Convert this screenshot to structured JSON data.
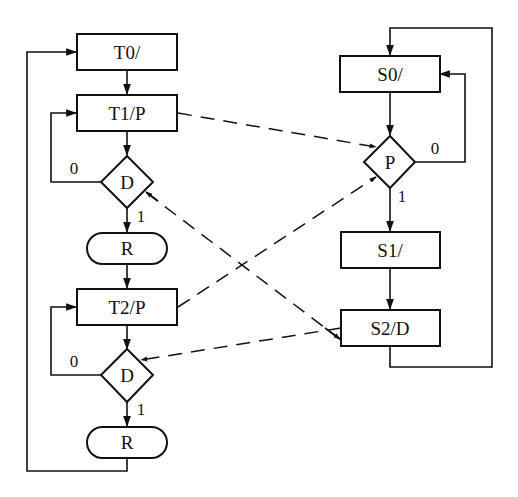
{
  "diagram": {
    "left_flow": {
      "nodes": [
        {
          "id": "T0",
          "type": "box",
          "label": "T0/"
        },
        {
          "id": "T1",
          "type": "box",
          "label": "T1/P"
        },
        {
          "id": "D1",
          "type": "decision",
          "label": "D"
        },
        {
          "id": "R1",
          "type": "terminal",
          "label": "R"
        },
        {
          "id": "T2",
          "type": "box",
          "label": "T2/P"
        },
        {
          "id": "D2",
          "type": "decision",
          "label": "D"
        },
        {
          "id": "R2",
          "type": "terminal",
          "label": "R"
        }
      ],
      "edge_labels": {
        "d1_no": "0",
        "d1_yes": "1",
        "d2_no": "0",
        "d2_yes": "1"
      }
    },
    "right_flow": {
      "nodes": [
        {
          "id": "S0",
          "type": "box",
          "label": "S0/"
        },
        {
          "id": "P",
          "type": "decision",
          "label": "P"
        },
        {
          "id": "S1",
          "type": "box",
          "label": "S1/"
        },
        {
          "id": "S2",
          "type": "box",
          "label": "S2/D"
        }
      ],
      "edge_labels": {
        "p_no": "0",
        "p_yes": "1"
      }
    },
    "solid_edges": [
      {
        "from": "T0",
        "to": "T1"
      },
      {
        "from": "T1",
        "to": "D1"
      },
      {
        "from": "D1",
        "to": "T1",
        "label": "0"
      },
      {
        "from": "D1",
        "to": "R1",
        "label": "1"
      },
      {
        "from": "R1",
        "to": "T2"
      },
      {
        "from": "T2",
        "to": "D2"
      },
      {
        "from": "D2",
        "to": "T2",
        "label": "0"
      },
      {
        "from": "D2",
        "to": "R2",
        "label": "1"
      },
      {
        "from": "R2",
        "to": "T0"
      },
      {
        "from": "S0",
        "to": "P"
      },
      {
        "from": "P",
        "to": "S0",
        "label": "0"
      },
      {
        "from": "P",
        "to": "S1",
        "label": "1"
      },
      {
        "from": "S1",
        "to": "S2"
      },
      {
        "from": "S2",
        "to": "S0"
      }
    ],
    "dashed_edges": [
      {
        "from": "T1",
        "to": "P"
      },
      {
        "from": "T2",
        "to": "P"
      },
      {
        "from": "S2",
        "to": "D1"
      },
      {
        "from": "S2",
        "to": "D2"
      }
    ]
  }
}
